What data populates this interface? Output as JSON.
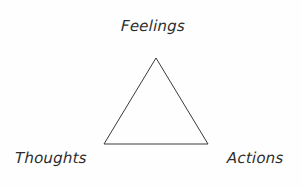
{
  "diagram": {
    "type": "cognitive-triangle",
    "background_color": "#fefefe",
    "stroke_color": "#3a3a3a",
    "text_color": "#2d2d2d",
    "canvas": {
      "width": 302,
      "height": 187
    },
    "shape": {
      "name": "triangle",
      "fill": "none",
      "stroke_width": 1,
      "points": "156,58 208,144 104,144",
      "vertices": [
        {
          "name": "apex",
          "x": 156,
          "y": 58
        },
        {
          "name": "base-right",
          "x": 208,
          "y": 144
        },
        {
          "name": "base-left",
          "x": 104,
          "y": 144
        }
      ]
    },
    "labels": {
      "top": "Feelings",
      "bottom_left": "Thoughts",
      "bottom_right": "Actions"
    }
  }
}
